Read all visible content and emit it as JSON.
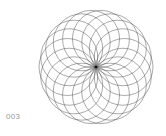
{
  "figure": {
    "label": "003",
    "pattern": {
      "type": "rosette-of-circles",
      "center": [
        96,
        67
      ],
      "circle_count": 18,
      "circle_radius": 28.5,
      "stroke_color": "#555555",
      "center_dot_color": "#111111"
    }
  }
}
